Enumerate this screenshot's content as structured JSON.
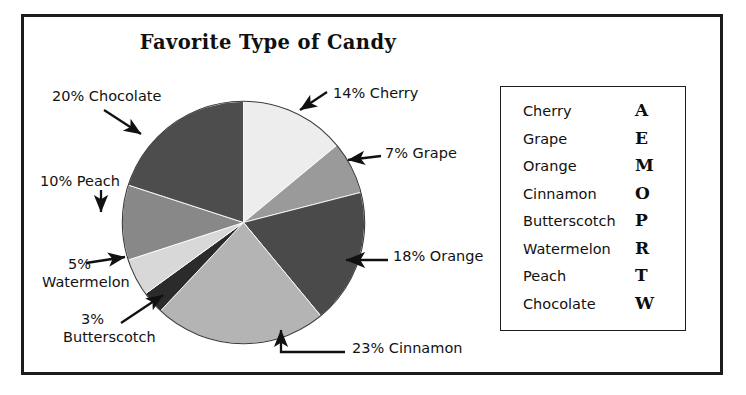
{
  "chart_data": {
    "type": "pie",
    "title": "Favorite Type of Candy",
    "unit": "percent",
    "start_angle_deg": 0,
    "direction": "clockwise",
    "categories": [
      "Cherry",
      "Grape",
      "Orange",
      "Cinnamon",
      "Butterscotch",
      "Watermelon",
      "Peach",
      "Chocolate"
    ],
    "values": [
      14,
      7,
      18,
      23,
      3,
      5,
      10,
      20
    ],
    "slices": [
      {
        "label": "Cherry",
        "value": 14,
        "color": "#ededed"
      },
      {
        "label": "Grape",
        "value": 7,
        "color": "#9a9a9a"
      },
      {
        "label": "Orange",
        "value": 18,
        "color": "#4a4a4a"
      },
      {
        "label": "Cinnamon",
        "value": 23,
        "color": "#b4b4b4"
      },
      {
        "label": "Butterscotch",
        "value": 3,
        "color": "#2b2b2b"
      },
      {
        "label": "Watermelon",
        "value": 5,
        "color": "#d8d8d8"
      },
      {
        "label": "Peach",
        "value": 10,
        "color": "#888888"
      },
      {
        "label": "Chocolate",
        "value": 20,
        "color": "#4d4d4d"
      }
    ],
    "xlabel": "",
    "ylabel": "",
    "legend_position": "right",
    "grid": false
  },
  "callouts": {
    "chocolate": "20% Chocolate",
    "peach": "10% Peach",
    "watermelon_pct": "5%",
    "watermelon_name": "Watermelon",
    "butterscotch_pct": "3%",
    "butterscotch_name": "Butterscotch",
    "cherry": "14% Cherry",
    "grape": "7% Grape",
    "orange": "18% Orange",
    "cinnamon": "23% Cinnamon"
  },
  "legend": {
    "rows": [
      {
        "name": "Cherry",
        "letter": "A"
      },
      {
        "name": "Grape",
        "letter": "E"
      },
      {
        "name": "Orange",
        "letter": "M"
      },
      {
        "name": "Cinnamon",
        "letter": "O"
      },
      {
        "name": "Butterscotch",
        "letter": "P"
      },
      {
        "name": "Watermelon",
        "letter": "R"
      },
      {
        "name": "Peach",
        "letter": "T"
      },
      {
        "name": "Chocolate",
        "letter": "W"
      }
    ]
  },
  "colors": {
    "frame": "#1c1c1c",
    "text": "#111111",
    "background": "#ffffff"
  }
}
